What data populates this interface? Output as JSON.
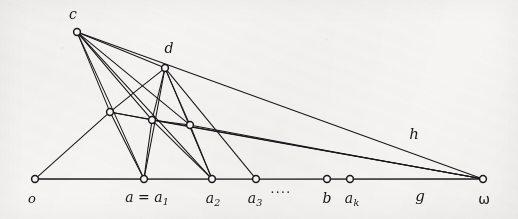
{
  "figure": {
    "medium": "hand-drawn ink on paper (scanned)",
    "width": 518,
    "height": 219,
    "background_color": "#f6f5f3",
    "ink_color": "#18161a"
  },
  "diagram_data": {
    "type": "graph",
    "node_radius": 3.4,
    "node_fill": "#f6f5f3",
    "node_stroke": "#18161a",
    "baseline": {
      "y": 179,
      "x_start": 35,
      "x_end": 483
    },
    "nodes": [
      {
        "id": "c",
        "x": 77,
        "y": 32,
        "label": "c",
        "label_x": 73,
        "label_y": 14,
        "label_size": 14,
        "on_baseline": false
      },
      {
        "id": "d",
        "x": 165,
        "y": 68,
        "label": "d",
        "label_x": 169,
        "label_y": 48,
        "label_size": 14,
        "on_baseline": false
      },
      {
        "id": "m1",
        "x": 110,
        "y": 112,
        "label": "",
        "label_x": 0,
        "label_y": 0,
        "label_size": 0,
        "on_baseline": false
      },
      {
        "id": "m2",
        "x": 152,
        "y": 120,
        "label": "",
        "label_x": 0,
        "label_y": 0,
        "label_size": 0,
        "on_baseline": false
      },
      {
        "id": "m3",
        "x": 190,
        "y": 125,
        "label": "",
        "label_x": 0,
        "label_y": 0,
        "label_size": 0,
        "on_baseline": false
      },
      {
        "id": "o",
        "x": 35,
        "y": 179,
        "label": "o",
        "label_x": 32,
        "label_y": 198,
        "label_size": 13,
        "on_baseline": true
      },
      {
        "id": "a1",
        "x": 144,
        "y": 179,
        "label": "a = a",
        "sub": "1",
        "label_x": 147,
        "label_y": 198,
        "label_size": 14,
        "on_baseline": true
      },
      {
        "id": "a2",
        "x": 212,
        "y": 179,
        "label": "a",
        "sub": "2",
        "label_x": 213,
        "label_y": 199,
        "label_size": 14,
        "on_baseline": true
      },
      {
        "id": "a3",
        "x": 256,
        "y": 179,
        "label": "a",
        "sub": "3",
        "label_x": 255,
        "label_y": 199,
        "label_size": 14,
        "on_baseline": true
      },
      {
        "id": "b",
        "x": 327,
        "y": 179,
        "label": "b",
        "label_x": 327,
        "label_y": 198,
        "label_size": 14,
        "on_baseline": true
      },
      {
        "id": "ak",
        "x": 350,
        "y": 179,
        "label": "a",
        "sub": "k",
        "label_x": 352,
        "label_y": 199,
        "label_size": 14,
        "on_baseline": true
      },
      {
        "id": "w",
        "x": 483,
        "y": 179,
        "label": "ω",
        "label_x": 484,
        "label_y": 199,
        "label_size": 14,
        "on_baseline": true
      }
    ],
    "edges": [
      {
        "from": "o",
        "to": "w",
        "note": "baseline axis"
      },
      {
        "from": "o",
        "to": "m1"
      },
      {
        "from": "c",
        "to": "d"
      },
      {
        "from": "c",
        "to": "m1"
      },
      {
        "from": "c",
        "to": "m2"
      },
      {
        "from": "c",
        "to": "m3"
      },
      {
        "from": "c",
        "to": "a1"
      },
      {
        "from": "c",
        "to": "a2"
      },
      {
        "from": "c",
        "to": "w"
      },
      {
        "from": "d",
        "to": "m1"
      },
      {
        "from": "d",
        "to": "m2"
      },
      {
        "from": "d",
        "to": "m3"
      },
      {
        "from": "d",
        "to": "a1"
      },
      {
        "from": "d",
        "to": "a2"
      },
      {
        "from": "d",
        "to": "a3"
      },
      {
        "from": "m1",
        "to": "m2"
      },
      {
        "from": "m2",
        "to": "m3"
      },
      {
        "from": "m1",
        "to": "a1"
      },
      {
        "from": "m2",
        "to": "a1"
      },
      {
        "from": "m2",
        "to": "a2"
      },
      {
        "from": "m3",
        "to": "a2"
      },
      {
        "from": "m1",
        "to": "w"
      },
      {
        "from": "m2",
        "to": "w"
      },
      {
        "from": "m3",
        "to": "w"
      }
    ],
    "free_labels": [
      {
        "id": "h",
        "text": "h",
        "x": 414,
        "y": 134,
        "size": 15,
        "style": "italic"
      },
      {
        "id": "g",
        "text": "g",
        "x": 420,
        "y": 196,
        "size": 15,
        "style": "italic"
      },
      {
        "id": "dots",
        "text": "····",
        "x": 281,
        "y": 193,
        "size": 12,
        "style": "normal"
      }
    ]
  }
}
